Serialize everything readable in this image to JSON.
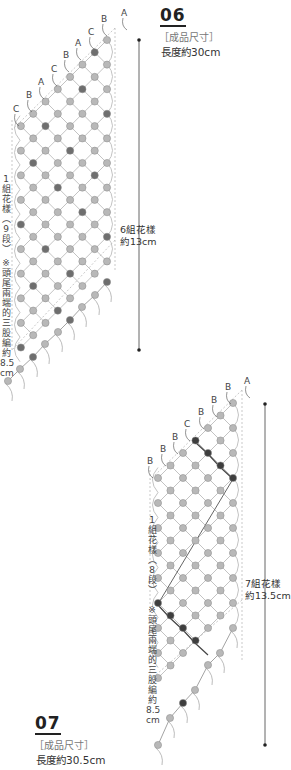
{
  "pattern06": {
    "number": "06",
    "size_heading": "［成品尺寸］",
    "size_value": "長度約30cm",
    "repeat_label_line1": "6組花樣",
    "repeat_label_line2": "約13cm",
    "left_label_repeat": [
      "1",
      "組",
      "花",
      "樣",
      "︵",
      "9",
      "段",
      "︶"
    ],
    "left_label_note": [
      "※",
      "頭",
      "尾",
      "兩",
      "端",
      "的",
      "三",
      "股",
      "編",
      "約",
      "8.5",
      "cm"
    ],
    "strand_labels": [
      "A",
      "B",
      "C",
      "A",
      "B",
      "C",
      "A",
      "B",
      "C"
    ],
    "colors": {
      "light": "#b8b8b8",
      "dark": "#6e6e6e",
      "line": "#bcbcbc"
    }
  },
  "pattern07": {
    "number": "07",
    "size_heading": "［成品尺寸］",
    "size_value": "長度約30.5cm",
    "repeat_label_line1": "7組花樣",
    "repeat_label_line2": "約13.5cm",
    "left_label_repeat": [
      "1",
      "組",
      "花",
      "樣",
      "︵",
      "8",
      "段",
      "︶"
    ],
    "left_label_note": [
      "※",
      "頭",
      "尾",
      "兩",
      "端",
      "的",
      "三",
      "股",
      "編",
      "約",
      "8.5",
      "cm"
    ],
    "strand_labels": [
      "A",
      "B",
      "B",
      "B",
      "C",
      "B",
      "B",
      "B"
    ],
    "colors": {
      "light": "#b8b8b8",
      "dark": "#3e3e3e",
      "line": "#bcbcbc"
    }
  }
}
